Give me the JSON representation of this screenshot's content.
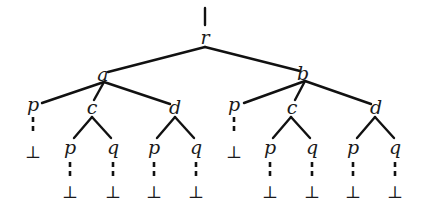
{
  "diagram": {
    "type": "tree",
    "root": {
      "label": "r",
      "children": [
        {
          "label": "a",
          "children": [
            {
              "label": "p",
              "children": [
                {
                  "label": "⊥"
                }
              ]
            },
            {
              "label": "c",
              "children": [
                {
                  "label": "p",
                  "children": [
                    {
                      "label": "⊥"
                    }
                  ]
                },
                {
                  "label": "q",
                  "children": [
                    {
                      "label": "⊥"
                    }
                  ]
                }
              ]
            },
            {
              "label": "d",
              "children": [
                {
                  "label": "p",
                  "children": [
                    {
                      "label": "⊥"
                    }
                  ]
                },
                {
                  "label": "q",
                  "children": [
                    {
                      "label": "⊥"
                    }
                  ]
                }
              ]
            }
          ]
        },
        {
          "label": "b",
          "children": [
            {
              "label": "p",
              "children": [
                {
                  "label": "⊥"
                }
              ]
            },
            {
              "label": "c",
              "children": [
                {
                  "label": "p",
                  "children": [
                    {
                      "label": "⊥"
                    }
                  ]
                },
                {
                  "label": "q",
                  "children": [
                    {
                      "label": "⊥"
                    }
                  ]
                }
              ]
            },
            {
              "label": "d",
              "children": [
                {
                  "label": "p",
                  "children": [
                    {
                      "label": "⊥"
                    }
                  ]
                },
                {
                  "label": "q",
                  "children": [
                    {
                      "label": "⊥"
                    }
                  ]
                }
              ]
            }
          ]
        }
      ]
    },
    "labels": {
      "r": "r",
      "a": "a",
      "b": "b",
      "a_p": "p",
      "a_c": "c",
      "a_d": "d",
      "b_p": "p",
      "b_c": "c",
      "b_d": "d",
      "a_c_p": "p",
      "a_c_q": "q",
      "a_d_p": "p",
      "a_d_q": "q",
      "b_c_p": "p",
      "b_c_q": "q",
      "b_d_p": "p",
      "b_d_q": "q",
      "bottom": "⊥"
    },
    "edge_style": {
      "solid": "parent-child",
      "dashed": "leaf-to-bottom"
    },
    "colors": {
      "line": "#111111",
      "background": "#ffffff"
    }
  }
}
